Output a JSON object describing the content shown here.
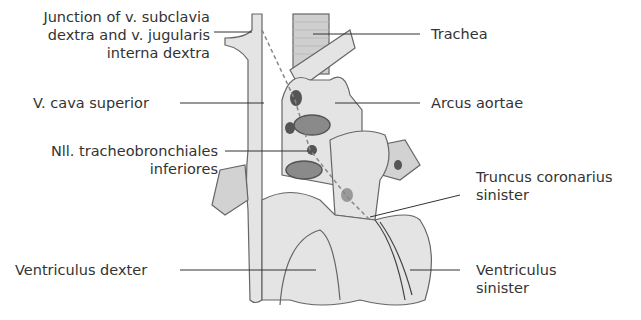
{
  "figure": {
    "colors": {
      "organ_fill": "#e4e4e4",
      "outline": "#555555",
      "lymph_node": "#555555",
      "vessel_lumen": "#8a8a8a",
      "leader_line": "#333333"
    }
  },
  "labels": {
    "junction": {
      "line1": "Junction of v. subclavia",
      "line2": "dextra and v. jugularis",
      "line3": "interna dextra"
    },
    "vcava": "V. cava superior",
    "nll": {
      "line1": "Nll. tracheobronchiales",
      "line2": "inferiores"
    },
    "ventriculus_dexter": "Ventriculus dexter",
    "trachea": "Trachea",
    "arcus": "Arcus aortae",
    "truncus": {
      "line1": "Truncus coronarius",
      "line2": "sinister"
    },
    "ventriculus_sinister": {
      "line1": "Ventriculus",
      "line2": "sinister"
    }
  }
}
